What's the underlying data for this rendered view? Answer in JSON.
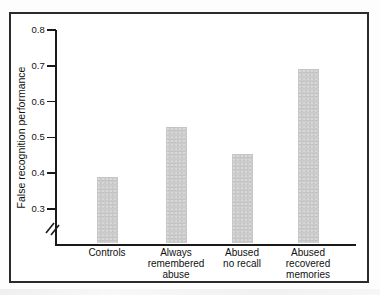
{
  "chart_data": {
    "type": "bar",
    "title": "",
    "ylabel": "False recognition performance",
    "xlabel": "",
    "categories": [
      "Controls",
      "Always remembered abuse",
      "Abused no recall",
      "Abused recovered memories"
    ],
    "category_lines": [
      [
        "Controls"
      ],
      [
        "Always",
        "remembered",
        "abuse"
      ],
      [
        "Abused",
        "no recall"
      ],
      [
        "Abused",
        "recovered",
        "memories"
      ]
    ],
    "values": [
      0.39,
      0.53,
      0.455,
      0.69
    ],
    "ylim": [
      0.3,
      0.8
    ],
    "yticks": [
      0.3,
      0.4,
      0.5,
      0.6,
      0.7,
      0.8
    ],
    "ytick_labels": [
      "0.3",
      "0.4",
      "0.5",
      "0.6",
      "0.7",
      "0.8"
    ],
    "axis_break_below_min": true,
    "grid": false,
    "legend": "none"
  },
  "colors": {
    "bar_fill": "#cbcbcb",
    "axis": "#1a1a1a",
    "text": "#111111",
    "frame_border": "#2b2b2b",
    "background": "#ffffff"
  }
}
